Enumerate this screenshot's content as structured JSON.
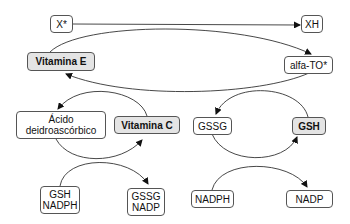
{
  "diagram": {
    "nodes": {
      "x_radical": {
        "label": "X*"
      },
      "xh": {
        "label": "XH"
      },
      "vitamin_e": {
        "label": "Vitamina E"
      },
      "alfa_to": {
        "label": "alfa-TO*"
      },
      "dehydroascorbic": {
        "label": "Ácido\ndeidroascórbico"
      },
      "vitamin_c": {
        "label": "Vitamina C"
      },
      "gssg_top": {
        "label": "GSSG"
      },
      "gsh_top": {
        "label": "GSH"
      },
      "gsh_nadph": {
        "label": "GSH\nNADPH"
      },
      "gssg_nadp": {
        "label": "GSSG\nNADP"
      },
      "nadph": {
        "label": "NADPH"
      },
      "nadp": {
        "label": "NADP"
      }
    },
    "edges": [
      {
        "from": "X*",
        "to": "XH"
      },
      {
        "from": "Vitamina E",
        "to": "alfa-TO*"
      },
      {
        "from": "alfa-TO*",
        "to": "Vitamina E"
      },
      {
        "from": "Vitamina C",
        "to": "Ácido deidroascórbico"
      },
      {
        "from": "GSH",
        "to": "GSSG"
      },
      {
        "from": "Ácido deidroascórbico",
        "to": "Vitamina C"
      },
      {
        "from": "GSH NADPH",
        "to": "GSSG NADP"
      },
      {
        "from": "GSSG",
        "to": "GSH"
      },
      {
        "from": "NADPH",
        "to": "NADP"
      }
    ],
    "colors": {
      "highlight_fill": "#e4e4e4",
      "border": "#555555",
      "line": "#222222"
    }
  }
}
